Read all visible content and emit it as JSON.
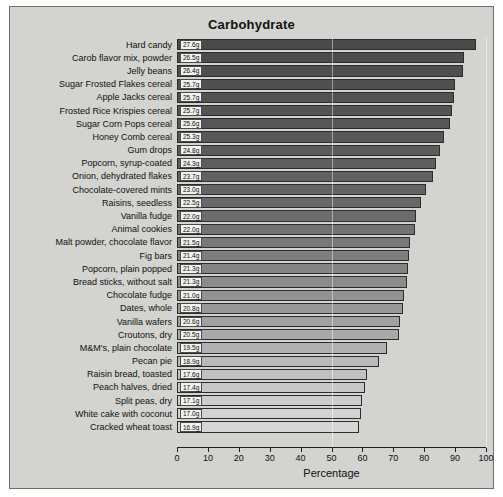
{
  "chart_data": {
    "type": "bar",
    "orientation": "horizontal",
    "title": "Carbohydrate",
    "xlabel": "Percentage",
    "ylabel": "",
    "xlim": [
      0,
      100
    ],
    "xticks": [
      0,
      10,
      20,
      30,
      40,
      50,
      60,
      70,
      80,
      90,
      100
    ],
    "grid": false,
    "legend": null,
    "categories": [
      "Hard candy",
      "Carob flavor mix, powder",
      "Jelly beans",
      "Sugar Frosted Flakes cereal",
      "Apple Jacks cereal",
      "Frosted Rice Krispies cereal",
      "Sugar Corn Pops cereal",
      "Honey Comb cereal",
      "Gum drops",
      "Popcorn, syrup-coated",
      "Onion, dehydrated flakes",
      "Chocolate-covered mints",
      "Raisins, seedless",
      "Vanilla fudge",
      "Animal cookies",
      "Malt powder, chocolate flavor",
      "Fig bars",
      "Popcorn, plain popped",
      "Bread sticks, without salt",
      "Chocolate fudge",
      "Dates, whole",
      "Vanilla wafers",
      "Croutons, dry",
      "M&M's, plain chocolate",
      "Pecan pie",
      "Raisin bread, toasted",
      "Peach halves, dried",
      "Split peas, dry",
      "White cake with coconut",
      "Cracked wheat toast"
    ],
    "values": [
      96.7,
      92.8,
      92.5,
      90.0,
      89.5,
      89.0,
      88.2,
      86.5,
      85.2,
      83.9,
      82.9,
      80.6,
      79.0,
      77.5,
      77.0,
      75.5,
      75.0,
      74.7,
      74.5,
      73.5,
      73.0,
      72.2,
      71.8,
      68.0,
      65.5,
      61.6,
      60.9,
      60.0,
      59.6,
      59.0
    ],
    "value_labels": [
      "27.6g",
      "26.5g",
      "26.4g",
      "25.7g",
      "25.7g",
      "25.7g",
      "25.6g",
      "25.3g",
      "24.8g",
      "24.3g",
      "23.7g",
      "23.0g",
      "22.5g",
      "22.0g",
      "22.0g",
      "21.5g",
      "21.4g",
      "21.3g",
      "21.3g",
      "21.0g",
      "20.8g",
      "20.6g",
      "20.5g",
      "19.5g",
      "18.9g",
      "17.6g",
      "17.4g",
      "17.1g",
      "17.0g",
      "16.9g"
    ],
    "bar_colors": [
      "#4a4a4a",
      "#4c4c4c",
      "#4e4e4e",
      "#505050",
      "#525252",
      "#545454",
      "#565656",
      "#585858",
      "#5b5b5b",
      "#5e5e5e",
      "#616161",
      "#646464",
      "#686868",
      "#6d6d6d",
      "#727272",
      "#787878",
      "#7e7e7e",
      "#848484",
      "#8b8b8b",
      "#929292",
      "#999999",
      "#a1a1a1",
      "#a9a9a9",
      "#b1b1b1",
      "#b9b9b9",
      "#c1c1c1",
      "#c7c7c7",
      "#cdcdcd",
      "#d2d2d2",
      "#d6d6d6"
    ],
    "plot_background": "#d3d3d0"
  }
}
